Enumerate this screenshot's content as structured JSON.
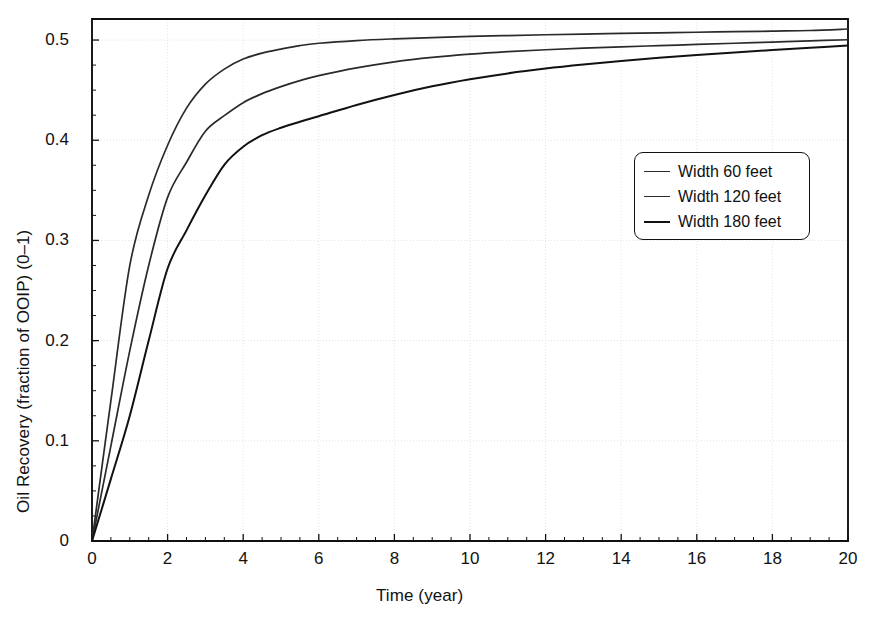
{
  "chart_data": {
    "type": "line",
    "title": "",
    "xlabel": "Time (year)",
    "ylabel": "Oil Recovery (fraction of OOIP) (0–1)",
    "xlim": [
      0,
      20
    ],
    "ylim": [
      0,
      0.521
    ],
    "xticks": [
      0,
      2,
      4,
      6,
      8,
      10,
      12,
      14,
      16,
      18,
      20
    ],
    "xtick_labels": [
      "0",
      "2",
      "4",
      "6",
      "8",
      "10",
      "12",
      "14",
      "16",
      "18",
      "20"
    ],
    "yticks": [
      0,
      0.1,
      0.2,
      0.3,
      0.4,
      0.5
    ],
    "ytick_labels": [
      "0",
      "0.1",
      "0.2",
      "0.3",
      "0.4",
      "0.5"
    ],
    "grid": true,
    "minor_ticks": true,
    "legend_position": "center-right",
    "x": [
      0,
      0.5,
      1,
      1.5,
      2,
      2.5,
      3,
      3.5,
      4,
      4.5,
      5,
      5.5,
      6,
      7,
      8,
      9,
      10,
      11,
      12,
      13,
      14,
      15,
      16,
      17,
      18,
      19,
      20
    ],
    "series": [
      {
        "name": "Width 60 feet",
        "color": "#2a2a2a",
        "linewidth": 1.7,
        "values": [
          0,
          0.14,
          0.275,
          0.345,
          0.395,
          0.432,
          0.456,
          0.471,
          0.481,
          0.487,
          0.491,
          0.4945,
          0.4968,
          0.4995,
          0.5012,
          0.5025,
          0.5036,
          0.5045,
          0.5053,
          0.506,
          0.5066,
          0.5072,
          0.5078,
          0.5083,
          0.5089,
          0.5095,
          0.511
        ]
      },
      {
        "name": "Width 120 feet",
        "color": "#2a2a2a",
        "linewidth": 1.7,
        "values": [
          0,
          0.095,
          0.19,
          0.275,
          0.343,
          0.378,
          0.409,
          0.4245,
          0.4375,
          0.4465,
          0.4535,
          0.4595,
          0.4645,
          0.4723,
          0.4782,
          0.4826,
          0.4859,
          0.4884,
          0.4903,
          0.4919,
          0.4932,
          0.4944,
          0.4956,
          0.4968,
          0.498,
          0.4992,
          0.5003
        ]
      },
      {
        "name": "Width 180 feet",
        "color": "#111111",
        "linewidth": 2.0,
        "values": [
          0,
          0.062,
          0.125,
          0.2,
          0.272,
          0.31,
          0.345,
          0.3755,
          0.3935,
          0.405,
          0.4125,
          0.4185,
          0.424,
          0.4352,
          0.4452,
          0.4538,
          0.4608,
          0.4667,
          0.4715,
          0.4755,
          0.479,
          0.4822,
          0.485,
          0.4876,
          0.49,
          0.4923,
          0.4945
        ]
      }
    ]
  },
  "legend": {
    "entries": [
      {
        "label": "Width 60 feet"
      },
      {
        "label": "Width 120 feet"
      },
      {
        "label": "Width 180 feet"
      }
    ]
  }
}
